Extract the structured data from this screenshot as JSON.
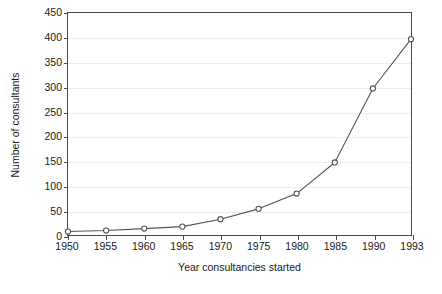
{
  "chart_data": {
    "type": "line",
    "title": "",
    "xlabel": "Year consultancies started",
    "ylabel": "Number of consultants",
    "categories": [
      "1950",
      "1955",
      "1960",
      "1965",
      "1970",
      "1975",
      "1980",
      "1985",
      "1990",
      "1993"
    ],
    "values": [
      7,
      9,
      13,
      17,
      32,
      53,
      84,
      147,
      297,
      397
    ],
    "ylim": [
      0,
      450
    ],
    "yticks": [
      0,
      50,
      100,
      150,
      200,
      250,
      300,
      350,
      400,
      450
    ],
    "ytick_labels": [
      "0",
      "50",
      "100",
      "150",
      "200",
      "250",
      "300",
      "350",
      "400",
      "450"
    ],
    "grid": "horizontal",
    "legend": "none",
    "marker": "open-circle",
    "line_color": "#555555",
    "marker_color": "#555555",
    "grid_color": "#ededed",
    "axis_color": "#4a4a4a"
  }
}
